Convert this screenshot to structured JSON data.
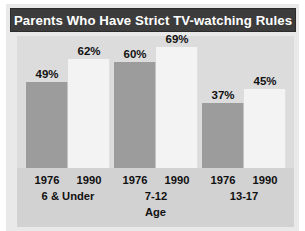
{
  "title": "Parents Who Have Strict TV-watching Rules",
  "colors": {
    "title_bar": "#3c3c3c",
    "title_text": "#ffffff",
    "plot_background": "#dcdcdc",
    "axis_band": "#d2d2d2",
    "bar_1976": "#9c9c9c",
    "bar_1990": "#f3f3f3",
    "label_text": "#111111"
  },
  "chart_data": {
    "type": "bar",
    "title": "Parents Who Have Strict TV-watching Rules",
    "xlabel": "Age",
    "ylabel": "",
    "ylim": [
      0,
      75
    ],
    "grid": false,
    "legend_position": "none",
    "categories": [
      "6 & Under",
      "7-12",
      "13-17"
    ],
    "series": [
      {
        "name": "1976",
        "values": [
          49,
          62,
          60
        ]
      },
      {
        "name": "1990",
        "values": [
          62,
          69,
          45
        ]
      }
    ],
    "bars": [
      {
        "group": "6 & Under",
        "year": "1976",
        "value": 49,
        "label": "49%",
        "style": "dark"
      },
      {
        "group": "6 & Under",
        "year": "1990",
        "value": 62,
        "label": "62%",
        "style": "light"
      },
      {
        "group": "7-12",
        "year": "1976",
        "value": 60,
        "label": "60%",
        "style": "dark"
      },
      {
        "group": "7-12",
        "year": "1990",
        "value": 69,
        "label": "69%",
        "style": "light"
      },
      {
        "group": "13-17",
        "year": "1976",
        "value": 37,
        "label": "37%",
        "style": "dark"
      },
      {
        "group": "13-17",
        "year": "1990",
        "value": 45,
        "label": "45%",
        "style": "light"
      }
    ],
    "tick_labels": [
      "1976",
      "1990",
      "1976",
      "1990",
      "1976",
      "1990"
    ],
    "group_labels": [
      "6 & Under",
      "7-12",
      "13-17"
    ],
    "annotations": []
  }
}
